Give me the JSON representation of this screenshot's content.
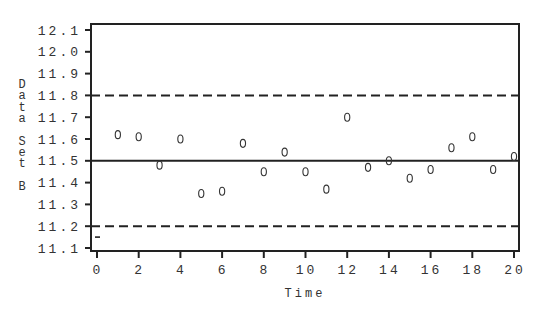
{
  "chart_data": {
    "type": "scatter",
    "title": "",
    "xlabel": "Time",
    "ylabel": "Data Set B",
    "xlim": [
      0,
      20
    ],
    "ylim": [
      11.1,
      12.1
    ],
    "x_ticks": [
      0,
      2,
      4,
      6,
      8,
      10,
      12,
      14,
      16,
      18,
      20
    ],
    "y_ticks": [
      "12.1",
      "12.0",
      "11.9",
      "11.8",
      "11.7",
      "11.6",
      "11.5",
      "11.4",
      "11.3",
      "11.2",
      "11.1"
    ],
    "grid": false,
    "legend": null,
    "reference_lines": [
      {
        "name": "upper control limit",
        "y": 11.8,
        "style": "dashed"
      },
      {
        "name": "center line",
        "y": 11.5,
        "style": "solid"
      },
      {
        "name": "lower control limit",
        "y": 11.2,
        "style": "dashed"
      }
    ],
    "series": [
      {
        "name": "Data Set B",
        "marker": "0",
        "x": [
          0,
          1,
          2,
          3,
          4,
          5,
          6,
          7,
          8,
          9,
          10,
          11,
          12,
          13,
          14,
          15,
          16,
          17,
          18,
          19,
          20
        ],
        "values": [
          11.15,
          11.62,
          11.61,
          11.48,
          11.6,
          11.35,
          11.36,
          11.58,
          11.45,
          11.54,
          11.45,
          11.37,
          11.7,
          11.47,
          11.5,
          11.42,
          11.46,
          11.56,
          11.61,
          11.46,
          11.52
        ],
        "marker_overrides": {
          "0": "-"
        }
      }
    ]
  },
  "labels": {
    "xlabel": "Time",
    "ylabel_chars": [
      "D",
      "a",
      "t",
      "a",
      "",
      "S",
      "e",
      "t",
      "",
      "B"
    ]
  }
}
